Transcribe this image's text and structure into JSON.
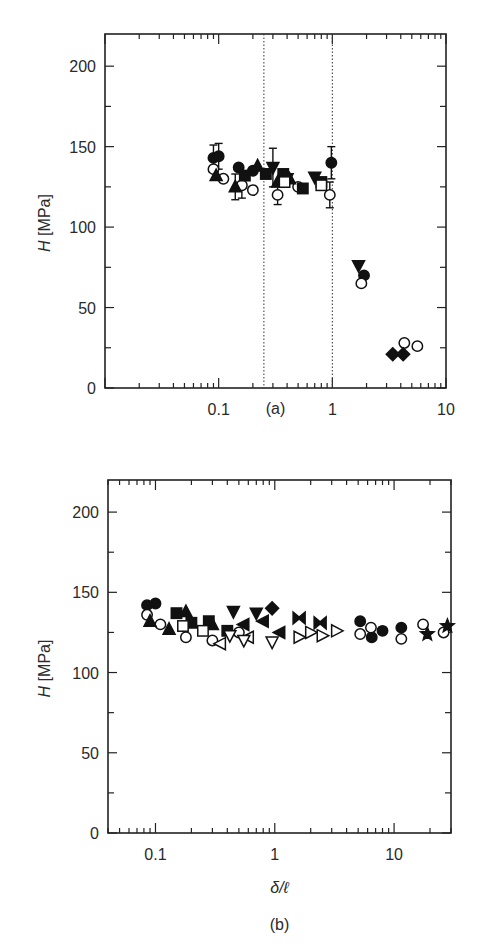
{
  "chart_data": [
    {
      "id": "a",
      "type": "scatter",
      "panel_label": "(a)",
      "title": "",
      "xlabel": "",
      "ylabel": "H [MPa]",
      "ylabel_italic_part": "H",
      "ylabel_unit": "[MPa]",
      "xscale": "log",
      "xlim": [
        0.01,
        10
      ],
      "ylim": [
        0,
        220
      ],
      "xticks": [
        {
          "value": 0.1,
          "label": "0.1"
        },
        {
          "value": 1,
          "label": "1"
        },
        {
          "value": 10,
          "label": "10"
        }
      ],
      "yticks": [
        {
          "value": 0,
          "label": "0"
        },
        {
          "value": 50,
          "label": "50"
        },
        {
          "value": 100,
          "label": "100"
        },
        {
          "value": 150,
          "label": "150"
        },
        {
          "value": 200,
          "label": "200"
        }
      ],
      "grid": false,
      "vlines": [
        {
          "x": 0.25,
          "style": "dotted"
        },
        {
          "x": 1,
          "style": "dotted"
        }
      ],
      "series": [
        {
          "name": "filled circle",
          "marker": "circle-filled",
          "points": [
            {
              "x": 0.09,
              "y": 143,
              "err": 8
            },
            {
              "x": 0.1,
              "y": 144,
              "err": 8
            },
            {
              "x": 0.15,
              "y": 137
            },
            {
              "x": 0.2,
              "y": 135
            },
            {
              "x": 0.98,
              "y": 140,
              "err": 10
            },
            {
              "x": 1.9,
              "y": 70
            }
          ]
        },
        {
          "name": "open circle",
          "marker": "circle-open",
          "points": [
            {
              "x": 0.09,
              "y": 136
            },
            {
              "x": 0.11,
              "y": 130
            },
            {
              "x": 0.16,
              "y": 126,
              "err": 8
            },
            {
              "x": 0.2,
              "y": 123
            },
            {
              "x": 0.33,
              "y": 120,
              "err": 6
            },
            {
              "x": 0.5,
              "y": 125
            },
            {
              "x": 0.95,
              "y": 120,
              "err": 8
            },
            {
              "x": 1.8,
              "y": 65
            },
            {
              "x": 4.3,
              "y": 28
            },
            {
              "x": 5.6,
              "y": 26
            }
          ]
        },
        {
          "name": "filled up-triangle",
          "marker": "triangle-up-filled",
          "points": [
            {
              "x": 0.095,
              "y": 132
            },
            {
              "x": 0.14,
              "y": 125,
              "err": 8
            },
            {
              "x": 0.22,
              "y": 138
            },
            {
              "x": 0.33,
              "y": 128
            },
            {
              "x": 0.42,
              "y": 130
            }
          ]
        },
        {
          "name": "filled down-triangle",
          "marker": "triangle-down-filled",
          "points": [
            {
              "x": 0.3,
              "y": 137,
              "err": 12
            },
            {
              "x": 0.4,
              "y": 130
            },
            {
              "x": 0.7,
              "y": 131
            },
            {
              "x": 1.7,
              "y": 76
            }
          ]
        },
        {
          "name": "filled square",
          "marker": "square-filled",
          "points": [
            {
              "x": 0.17,
              "y": 132
            },
            {
              "x": 0.26,
              "y": 133
            },
            {
              "x": 0.37,
              "y": 133
            },
            {
              "x": 0.55,
              "y": 124
            },
            {
              "x": 0.8,
              "y": 128
            }
          ]
        },
        {
          "name": "open square",
          "marker": "square-open",
          "points": [
            {
              "x": 0.38,
              "y": 128
            },
            {
              "x": 0.8,
              "y": 126
            }
          ]
        },
        {
          "name": "filled diamond",
          "marker": "diamond-filled",
          "points": [
            {
              "x": 3.4,
              "y": 21
            },
            {
              "x": 4.2,
              "y": 21
            }
          ]
        }
      ]
    },
    {
      "id": "b",
      "type": "scatter",
      "panel_label": "(b)",
      "title": "",
      "xlabel": "δ/ℓ",
      "ylabel": "H [MPa]",
      "ylabel_italic_part": "H",
      "ylabel_unit": "[MPa]",
      "xscale": "log",
      "xlim": [
        0.04,
        30
      ],
      "ylim": [
        0,
        220
      ],
      "xticks": [
        {
          "value": 0.1,
          "label": "0.1"
        },
        {
          "value": 1,
          "label": "1"
        },
        {
          "value": 10,
          "label": "10"
        }
      ],
      "yticks": [
        {
          "value": 0,
          "label": "0"
        },
        {
          "value": 50,
          "label": "50"
        },
        {
          "value": 100,
          "label": "100"
        },
        {
          "value": 150,
          "label": "150"
        },
        {
          "value": 200,
          "label": "200"
        }
      ],
      "grid": false,
      "vlines": [],
      "series": [
        {
          "name": "filled circle",
          "marker": "circle-filled",
          "points": [
            {
              "x": 0.085,
              "y": 142
            },
            {
              "x": 0.1,
              "y": 143
            },
            {
              "x": 5.2,
              "y": 132
            },
            {
              "x": 6.5,
              "y": 122
            },
            {
              "x": 8,
              "y": 126
            },
            {
              "x": 11.5,
              "y": 128
            }
          ]
        },
        {
          "name": "open circle",
          "marker": "circle-open",
          "points": [
            {
              "x": 0.085,
              "y": 136
            },
            {
              "x": 0.11,
              "y": 130
            },
            {
              "x": 0.18,
              "y": 122
            },
            {
              "x": 0.3,
              "y": 120
            },
            {
              "x": 0.5,
              "y": 125
            },
            {
              "x": 5.2,
              "y": 124
            },
            {
              "x": 6.4,
              "y": 128
            },
            {
              "x": 11.5,
              "y": 121
            },
            {
              "x": 17.5,
              "y": 130
            },
            {
              "x": 26,
              "y": 125
            }
          ]
        },
        {
          "name": "filled up-triangle",
          "marker": "triangle-up-filled",
          "points": [
            {
              "x": 0.09,
              "y": 132
            },
            {
              "x": 0.13,
              "y": 127
            },
            {
              "x": 0.18,
              "y": 138
            },
            {
              "x": 0.3,
              "y": 130
            }
          ]
        },
        {
          "name": "filled down-triangle",
          "marker": "triangle-down-filled",
          "points": [
            {
              "x": 0.45,
              "y": 138
            },
            {
              "x": 0.7,
              "y": 137
            }
          ]
        },
        {
          "name": "filled square",
          "marker": "square-filled",
          "points": [
            {
              "x": 0.15,
              "y": 137
            },
            {
              "x": 0.2,
              "y": 131
            },
            {
              "x": 0.28,
              "y": 132
            },
            {
              "x": 0.4,
              "y": 126
            }
          ]
        },
        {
          "name": "open square",
          "marker": "square-open",
          "points": [
            {
              "x": 0.17,
              "y": 129
            },
            {
              "x": 0.25,
              "y": 126
            }
          ]
        },
        {
          "name": "filled diamond",
          "marker": "diamond-filled",
          "points": [
            {
              "x": 0.95,
              "y": 140
            }
          ]
        },
        {
          "name": "filled left-triangle",
          "marker": "triangle-left-filled",
          "points": [
            {
              "x": 0.55,
              "y": 130
            },
            {
              "x": 0.8,
              "y": 132
            },
            {
              "x": 1.1,
              "y": 125
            }
          ]
        },
        {
          "name": "open left-triangle",
          "marker": "triangle-left-open",
          "points": [
            {
              "x": 0.35,
              "y": 118
            },
            {
              "x": 0.6,
              "y": 122
            }
          ]
        },
        {
          "name": "open down-triangle",
          "marker": "triangle-down-open",
          "points": [
            {
              "x": 0.42,
              "y": 123
            },
            {
              "x": 0.55,
              "y": 120
            },
            {
              "x": 0.95,
              "y": 119
            }
          ]
        },
        {
          "name": "open right-triangle",
          "marker": "triangle-right-open",
          "points": [
            {
              "x": 1.6,
              "y": 122
            },
            {
              "x": 2.0,
              "y": 125
            },
            {
              "x": 2.5,
              "y": 123
            },
            {
              "x": 3.3,
              "y": 126
            }
          ]
        },
        {
          "name": "bowtie",
          "marker": "bowtie-filled",
          "points": [
            {
              "x": 1.6,
              "y": 134
            },
            {
              "x": 2.4,
              "y": 131
            }
          ]
        },
        {
          "name": "filled star",
          "marker": "star-filled",
          "points": [
            {
              "x": 19,
              "y": 124
            },
            {
              "x": 28,
              "y": 129
            }
          ]
        }
      ]
    }
  ],
  "figure": {
    "panels": [
      {
        "label": "(a)"
      },
      {
        "label": "(b)"
      }
    ]
  }
}
